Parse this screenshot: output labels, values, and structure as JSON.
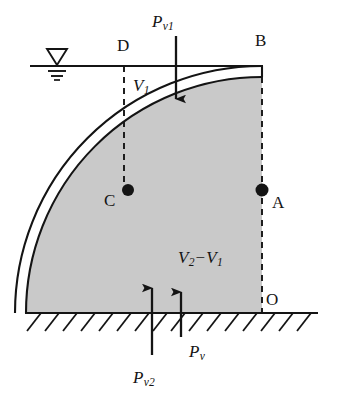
{
  "figure": {
    "type": "engineering-diagram",
    "colors": {
      "stroke": "#141414",
      "fill_gray": "#c9c9c9",
      "shell_white": "#ffffff",
      "background": "#ffffff"
    },
    "geometry": {
      "water_line_y": 66,
      "water_line_x_start": 30,
      "water_line_x_end": 263,
      "ground_line_y": 313,
      "ground_line_x_start": 25,
      "ground_line_x_end": 318,
      "arc_center_x": 262,
      "arc_center_y": 313,
      "arc_outer_radius": 247,
      "arc_inner_radius": 236,
      "dashed_left_x": 124,
      "dashed_right_x": 262
    }
  },
  "labels": {
    "point_d": "D",
    "point_b": "B",
    "point_c": "C",
    "point_a": "A",
    "point_o": "O",
    "pressure_v1": {
      "base": "P",
      "sub": "v1"
    },
    "pressure_v2": {
      "base": "P",
      "sub": "v2"
    },
    "pressure_v": {
      "base": "P",
      "sub": "v"
    },
    "volume_v1": {
      "base": "V",
      "sub": "1"
    },
    "volume_difference": {
      "base_a": "V",
      "sub_a": "2",
      "operator": "−",
      "base_b": "V",
      "sub_b": "1"
    }
  },
  "markers": {
    "water_table_symbol": "water-table-triangle",
    "ground_hatching": "diagonal-hatch-down-left",
    "node_dots": [
      "C",
      "A"
    ]
  },
  "arrows": [
    {
      "name": "pressure-v1-arrow",
      "direction": "down",
      "label": "P_v1",
      "x": 176,
      "y_start": 36,
      "y_end": 99
    },
    {
      "name": "pressure-v2-arrow",
      "direction": "up",
      "label": "P_v2",
      "x": 152,
      "y_start": 355,
      "y_end": 288
    },
    {
      "name": "pressure-v-arrow",
      "direction": "up",
      "label": "P_v",
      "x": 181,
      "y_start": 337,
      "y_end": 292
    }
  ]
}
